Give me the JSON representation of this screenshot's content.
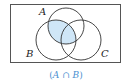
{
  "diagram": {
    "type": "venn",
    "sets": [
      {
        "id": "A",
        "label": "A"
      },
      {
        "id": "B",
        "label": "B"
      },
      {
        "id": "C",
        "label": "C"
      }
    ],
    "shaded_region": "A ∩ B",
    "caption": {
      "open": "(",
      "left": "A",
      "op": " ∩ ",
      "right": "B",
      "close": ")"
    },
    "colors": {
      "shade": "#cfe6f7",
      "outline": "#333333",
      "border": "#555555",
      "caption": "#4a8fd0"
    }
  }
}
